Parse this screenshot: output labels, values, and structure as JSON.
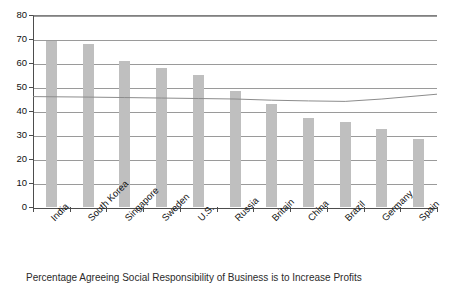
{
  "chart_data": {
    "type": "bar",
    "title": "",
    "subtitle": "",
    "xlabel": "",
    "ylabel": "",
    "ylim": [
      0,
      80
    ],
    "ytick_step": 10,
    "yticks": [
      0,
      10,
      20,
      30,
      40,
      50,
      60,
      70,
      80
    ],
    "grid": true,
    "legend_position": "none",
    "categories": [
      "India",
      "South Korea",
      "Singapore",
      "Sweden",
      "U.S.",
      "Russia",
      "Britain",
      "China",
      "Brazil",
      "Germany",
      "Spain"
    ],
    "series": [
      {
        "name": "Country value",
        "type": "bar",
        "color": "#bfbfbf",
        "values": [
          69,
          68,
          61,
          58,
          55,
          48.5,
          43,
          37,
          35.5,
          32.5,
          28.5
        ]
      },
      {
        "name": "Reference line",
        "type": "line",
        "color": "#8c8c8c",
        "values": [
          46,
          45.8,
          45.6,
          45.4,
          45.2,
          45,
          44.5,
          44.2,
          44,
          45,
          47
        ]
      }
    ],
    "annotations": []
  },
  "caption": {
    "text": "Percentage Agreeing Social Responsibility of Business is to Increase Profits"
  },
  "axis": {
    "y_tick_labels": [
      "80",
      "70",
      "60",
      "50",
      "40",
      "30",
      "20",
      "10",
      "0"
    ]
  }
}
